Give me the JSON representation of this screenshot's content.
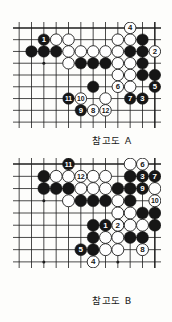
{
  "document": {
    "type": "go-game-reference-diagrams",
    "background_color": "#fdfdfb"
  },
  "figures": [
    {
      "id": "figure-a",
      "caption": "참고도 A",
      "board": {
        "cols": 12,
        "rows": 9,
        "edges": {
          "top": true,
          "right": true,
          "bottom": false,
          "left": false
        },
        "line_color": "#1d1d1d",
        "black_color": "#161616",
        "white_color": "#ffffff",
        "star_points": [
          {
            "col": 2,
            "row": 3
          }
        ]
      },
      "plain_stones": [
        {
          "col": 3,
          "row": 1,
          "color": "white"
        },
        {
          "col": 4,
          "row": 1,
          "color": "white"
        },
        {
          "col": 8,
          "row": 1,
          "color": "white"
        },
        {
          "col": 9,
          "row": 1,
          "color": "white"
        },
        {
          "col": 10,
          "row": 1,
          "color": "black"
        },
        {
          "col": 1,
          "row": 2,
          "color": "black"
        },
        {
          "col": 2,
          "row": 2,
          "color": "black"
        },
        {
          "col": 3,
          "row": 2,
          "color": "black"
        },
        {
          "col": 4,
          "row": 2,
          "color": "white"
        },
        {
          "col": 5,
          "row": 2,
          "color": "white"
        },
        {
          "col": 6,
          "row": 2,
          "color": "white"
        },
        {
          "col": 7,
          "row": 2,
          "color": "white"
        },
        {
          "col": 8,
          "row": 2,
          "color": "white"
        },
        {
          "col": 9,
          "row": 2,
          "color": "black"
        },
        {
          "col": 10,
          "row": 2,
          "color": "black"
        },
        {
          "col": 4,
          "row": 3,
          "color": "white"
        },
        {
          "col": 5,
          "row": 3,
          "color": "black"
        },
        {
          "col": 6,
          "row": 3,
          "color": "black"
        },
        {
          "col": 7,
          "row": 3,
          "color": "black"
        },
        {
          "col": 8,
          "row": 3,
          "color": "white"
        },
        {
          "col": 9,
          "row": 3,
          "color": "white"
        },
        {
          "col": 10,
          "row": 3,
          "color": "black"
        },
        {
          "col": 8,
          "row": 4,
          "color": "white"
        },
        {
          "col": 9,
          "row": 4,
          "color": "white"
        },
        {
          "col": 10,
          "row": 4,
          "color": "black"
        },
        {
          "col": 11,
          "row": 4,
          "color": "black"
        },
        {
          "col": 6,
          "row": 5,
          "color": "black"
        },
        {
          "col": 9,
          "row": 5,
          "color": "white"
        },
        {
          "col": 7,
          "row": 6,
          "color": "white"
        }
      ],
      "numbered_stones": [
        {
          "col": 2,
          "row": 1,
          "color": "black",
          "label": "1"
        },
        {
          "col": 11,
          "row": 2,
          "color": "white",
          "label": "2"
        },
        {
          "col": 10,
          "row": 6,
          "color": "black",
          "label": "3"
        },
        {
          "col": 9,
          "row": 0,
          "color": "white",
          "label": "4"
        },
        {
          "col": 11,
          "row": 5,
          "color": "black",
          "label": "5"
        },
        {
          "col": 8,
          "row": 5,
          "color": "white",
          "label": "6"
        },
        {
          "col": 9,
          "row": 6,
          "color": "black",
          "label": "7"
        },
        {
          "col": 6,
          "row": 7,
          "color": "white",
          "label": "8"
        },
        {
          "col": 5,
          "row": 7,
          "color": "black",
          "label": "9"
        },
        {
          "col": 5,
          "row": 6,
          "color": "white",
          "label": "10"
        },
        {
          "col": 4,
          "row": 6,
          "color": "black",
          "label": "11"
        },
        {
          "col": 7,
          "row": 7,
          "color": "white",
          "label": "12"
        }
      ]
    },
    {
      "id": "figure-b",
      "caption": "참고도 B",
      "board": {
        "cols": 12,
        "rows": 9,
        "edges": {
          "top": true,
          "right": true,
          "bottom": false,
          "left": false
        },
        "line_color": "#1d1d1d",
        "black_color": "#161616",
        "white_color": "#ffffff",
        "star_points": [
          {
            "col": 2,
            "row": 3
          },
          {
            "col": 2,
            "row": 8
          },
          {
            "col": 8,
            "row": 8
          }
        ]
      },
      "plain_stones": [
        {
          "col": 9,
          "row": 0,
          "color": "white"
        },
        {
          "col": 2,
          "row": 1,
          "color": "black"
        },
        {
          "col": 3,
          "row": 1,
          "color": "white"
        },
        {
          "col": 4,
          "row": 1,
          "color": "white"
        },
        {
          "col": 6,
          "row": 1,
          "color": "white"
        },
        {
          "col": 7,
          "row": 1,
          "color": "white"
        },
        {
          "col": 9,
          "row": 1,
          "color": "black"
        },
        {
          "col": 2,
          "row": 2,
          "color": "black"
        },
        {
          "col": 3,
          "row": 2,
          "color": "black"
        },
        {
          "col": 4,
          "row": 2,
          "color": "black"
        },
        {
          "col": 5,
          "row": 2,
          "color": "white"
        },
        {
          "col": 6,
          "row": 2,
          "color": "white"
        },
        {
          "col": 7,
          "row": 2,
          "color": "white"
        },
        {
          "col": 8,
          "row": 2,
          "color": "black"
        },
        {
          "col": 9,
          "row": 2,
          "color": "black"
        },
        {
          "col": 11,
          "row": 2,
          "color": "white"
        },
        {
          "col": 4,
          "row": 3,
          "color": "white"
        },
        {
          "col": 5,
          "row": 3,
          "color": "black"
        },
        {
          "col": 6,
          "row": 3,
          "color": "black"
        },
        {
          "col": 7,
          "row": 3,
          "color": "black"
        },
        {
          "col": 8,
          "row": 3,
          "color": "white"
        },
        {
          "col": 9,
          "row": 3,
          "color": "black"
        },
        {
          "col": 8,
          "row": 4,
          "color": "white"
        },
        {
          "col": 9,
          "row": 4,
          "color": "white"
        },
        {
          "col": 10,
          "row": 4,
          "color": "black"
        },
        {
          "col": 11,
          "row": 4,
          "color": "black"
        },
        {
          "col": 6,
          "row": 5,
          "color": "black"
        },
        {
          "col": 8,
          "row": 5,
          "color": "white"
        },
        {
          "col": 9,
          "row": 5,
          "color": "white"
        },
        {
          "col": 10,
          "row": 5,
          "color": "white"
        },
        {
          "col": 11,
          "row": 5,
          "color": "black"
        },
        {
          "col": 6,
          "row": 6,
          "color": "black"
        },
        {
          "col": 7,
          "row": 6,
          "color": "white"
        },
        {
          "col": 8,
          "row": 6,
          "color": "white"
        },
        {
          "col": 9,
          "row": 6,
          "color": "black"
        },
        {
          "col": 10,
          "row": 6,
          "color": "black"
        },
        {
          "col": 6,
          "row": 7,
          "color": "black"
        },
        {
          "col": 7,
          "row": 7,
          "color": "white"
        },
        {
          "col": 8,
          "row": 7,
          "color": "white"
        }
      ],
      "numbered_stones": [
        {
          "col": 7,
          "row": 5,
          "color": "black",
          "label": "1"
        },
        {
          "col": 8,
          "row": 5,
          "color": "white",
          "label": "2"
        },
        {
          "col": 10,
          "row": 1,
          "color": "black",
          "label": "3"
        },
        {
          "col": 6,
          "row": 8,
          "color": "white",
          "label": "4"
        },
        {
          "col": 5,
          "row": 7,
          "color": "black",
          "label": "5"
        },
        {
          "col": 10,
          "row": 0,
          "color": "white",
          "label": "6"
        },
        {
          "col": 11,
          "row": 1,
          "color": "black",
          "label": "7"
        },
        {
          "col": 10,
          "row": 7,
          "color": "white",
          "label": "8"
        },
        {
          "col": 10,
          "row": 2,
          "color": "black",
          "label": "9"
        },
        {
          "col": 11,
          "row": 3,
          "color": "white",
          "label": "10"
        },
        {
          "col": 4,
          "row": 0,
          "color": "black",
          "label": "11"
        },
        {
          "col": 5,
          "row": 1,
          "color": "white",
          "label": "12"
        }
      ]
    }
  ]
}
